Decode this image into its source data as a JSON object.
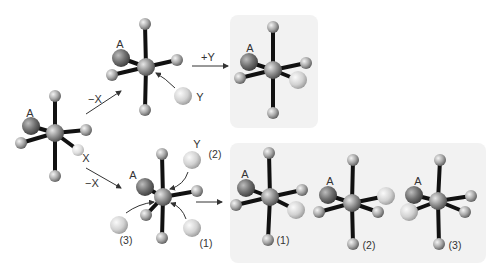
{
  "figure": {
    "colors": {
      "background": "#ffffff",
      "panel": "#f2f2f2",
      "bond": "#111111",
      "ligand": "#a9a9a9",
      "center": "#8f8f8f",
      "ligand_A": "#707070",
      "incoming_Y": "#d2d2d2",
      "leaving_X": "#dedede",
      "arrow": "#333333"
    },
    "labels": {
      "A": "A",
      "X": "X",
      "Y": "Y",
      "minus_X": "−X",
      "plus_Y": "+Y",
      "path_1": "(1)",
      "path_2": "(2)",
      "path_3": "(3)"
    }
  },
  "panels": [
    {
      "name": "product-panel-top",
      "x": 230,
      "y": 15,
      "w": 88,
      "h": 113
    },
    {
      "name": "product-panel-bottom",
      "x": 230,
      "y": 143,
      "w": 256,
      "h": 120
    }
  ],
  "molecules": [
    {
      "name": "reactant-octahedral-complex",
      "center": [
        55,
        133
      ],
      "balls": [
        {
          "role": "ligand",
          "pos": [
            55,
            96
          ],
          "r": 6
        },
        {
          "role": "ligand",
          "pos": [
            55,
            176
          ],
          "r": 6
        },
        {
          "role": "ligand_A",
          "pos": [
            31,
            126
          ],
          "r": 9
        },
        {
          "role": "ligand",
          "pos": [
            21,
            143
          ],
          "r": 6
        },
        {
          "role": "ligand",
          "pos": [
            86,
            130
          ],
          "r": 6
        },
        {
          "role": "leaving_X",
          "pos": [
            78,
            150
          ],
          "r": 6
        }
      ]
    },
    {
      "name": "intermediate-top-five-coordinate",
      "center": [
        146,
        67
      ],
      "balls": [
        {
          "role": "ligand",
          "pos": [
            145,
            24
          ],
          "r": 6
        },
        {
          "role": "ligand",
          "pos": [
            145,
            110
          ],
          "r": 6
        },
        {
          "role": "ligand_A",
          "pos": [
            121,
            58
          ],
          "r": 9
        },
        {
          "role": "ligand",
          "pos": [
            112,
            75
          ],
          "r": 6
        },
        {
          "role": "ligand",
          "pos": [
            177,
            60
          ],
          "r": 6
        }
      ]
    },
    {
      "name": "product-top",
      "center": [
        273,
        70
      ],
      "balls": [
        {
          "role": "ligand",
          "pos": [
            273,
            27
          ],
          "r": 6
        },
        {
          "role": "ligand",
          "pos": [
            273,
            113
          ],
          "r": 6
        },
        {
          "role": "ligand_A",
          "pos": [
            249,
            62
          ],
          "r": 9
        },
        {
          "role": "ligand",
          "pos": [
            240,
            78
          ],
          "r": 6
        },
        {
          "role": "ligand",
          "pos": [
            306,
            63
          ],
          "r": 6
        },
        {
          "role": "incoming_Y",
          "pos": [
            298,
            80
          ],
          "r": 9
        }
      ]
    },
    {
      "name": "intermediate-bottom-five-coordinate",
      "center": [
        163,
        197
      ],
      "balls": [
        {
          "role": "ligand",
          "pos": [
            162,
            154
          ],
          "r": 6
        },
        {
          "role": "ligand",
          "pos": [
            162,
            238
          ],
          "r": 6
        },
        {
          "role": "ligand_A",
          "pos": [
            145,
            187
          ],
          "r": 9
        },
        {
          "role": "ligand",
          "pos": [
            197,
            191
          ],
          "r": 6
        },
        {
          "role": "ligand",
          "pos": [
            146,
            215
          ],
          "r": 6
        }
      ]
    },
    {
      "name": "product-1",
      "center": [
        270,
        197
      ],
      "balls": [
        {
          "role": "ligand",
          "pos": [
            269,
            153
          ],
          "r": 6
        },
        {
          "role": "ligand",
          "pos": [
            268,
            240
          ],
          "r": 6
        },
        {
          "role": "ligand_A",
          "pos": [
            246,
            188
          ],
          "r": 9
        },
        {
          "role": "ligand",
          "pos": [
            236,
            205
          ],
          "r": 6
        },
        {
          "role": "ligand",
          "pos": [
            302,
            190
          ],
          "r": 6
        },
        {
          "role": "incoming_Y",
          "pos": [
            296,
            210
          ],
          "r": 9
        }
      ]
    },
    {
      "name": "product-2",
      "center": [
        352,
        203
      ],
      "balls": [
        {
          "role": "ligand",
          "pos": [
            353,
            160
          ],
          "r": 6
        },
        {
          "role": "ligand",
          "pos": [
            353,
            244
          ],
          "r": 6
        },
        {
          "role": "ligand_A",
          "pos": [
            328,
            195
          ],
          "r": 9
        },
        {
          "role": "ligand",
          "pos": [
            319,
            212
          ],
          "r": 6
        },
        {
          "role": "incoming_Y",
          "pos": [
            386,
            196
          ],
          "r": 9
        },
        {
          "role": "ligand",
          "pos": [
            378,
            212
          ],
          "r": 6
        }
      ]
    },
    {
      "name": "product-3",
      "center": [
        438,
        201
      ],
      "balls": [
        {
          "role": "ligand",
          "pos": [
            440,
            160
          ],
          "r": 6
        },
        {
          "role": "ligand",
          "pos": [
            439,
            244
          ],
          "r": 6
        },
        {
          "role": "ligand_A",
          "pos": [
            414,
            195
          ],
          "r": 9
        },
        {
          "role": "incoming_Y",
          "pos": [
            409,
            212
          ],
          "r": 9
        },
        {
          "role": "ligand",
          "pos": [
            471,
            196
          ],
          "r": 6
        },
        {
          "role": "ligand",
          "pos": [
            465,
            212
          ],
          "r": 6
        }
      ]
    }
  ],
  "free_ligands": [
    {
      "name": "incoming-Y-top",
      "pos": [
        183,
        96
      ],
      "r": 9
    },
    {
      "name": "incoming-Y-path-2",
      "pos": [
        192,
        160
      ],
      "r": 9
    },
    {
      "name": "incoming-Y-path-1",
      "pos": [
        192,
        228
      ],
      "r": 9
    },
    {
      "name": "incoming-Y-path-3",
      "pos": [
        119,
        225
      ],
      "r": 9
    }
  ],
  "arrows": [
    {
      "name": "arrow-loss-X-top",
      "from": [
        86,
        114
      ],
      "to": [
        121,
        91
      ],
      "straight": true
    },
    {
      "name": "arrow-loss-X-bottom",
      "from": [
        86,
        168
      ],
      "to": [
        121,
        188
      ],
      "straight": true
    },
    {
      "name": "arrow-add-Y-top",
      "from": [
        192,
        66
      ],
      "to": [
        228,
        66
      ],
      "straight": true
    },
    {
      "name": "arrow-to-products-bottom",
      "from": [
        196,
        202
      ],
      "to": [
        222,
        202
      ],
      "straight": true
    },
    {
      "name": "attack-arrow-top",
      "from": [
        175,
        88
      ],
      "ctrl": [
        165,
        78
      ],
      "to": [
        156,
        73
      ],
      "straight": false
    },
    {
      "name": "attack-arrow-path-2",
      "from": [
        188,
        172
      ],
      "ctrl": [
        184,
        185
      ],
      "to": [
        170,
        189
      ],
      "straight": false
    },
    {
      "name": "attack-arrow-path-1",
      "from": [
        186,
        219
      ],
      "ctrl": [
        182,
        207
      ],
      "to": [
        171,
        203
      ],
      "straight": false
    },
    {
      "name": "attack-arrow-path-3",
      "from": [
        126,
        213
      ],
      "ctrl": [
        138,
        204
      ],
      "to": [
        154,
        202
      ],
      "straight": false
    }
  ],
  "text_labels": [
    {
      "name": "label-A-reactant",
      "key": "A",
      "pos": [
        30,
        113
      ]
    },
    {
      "name": "label-X-reactant",
      "key": "X",
      "pos": [
        86,
        158
      ]
    },
    {
      "name": "label-minus-X-top",
      "key": "minus_X",
      "pos": [
        95,
        99
      ]
    },
    {
      "name": "label-minus-X-bottom",
      "key": "minus_X",
      "pos": [
        92,
        183
      ]
    },
    {
      "name": "label-A-intermediate-top",
      "key": "A",
      "pos": [
        120,
        44
      ]
    },
    {
      "name": "label-Y-top",
      "key": "Y",
      "pos": [
        200,
        97
      ]
    },
    {
      "name": "label-plus-Y",
      "key": "plus_Y",
      "pos": [
        208,
        57
      ]
    },
    {
      "name": "label-A-product-top",
      "key": "A",
      "pos": [
        250,
        48
      ]
    },
    {
      "name": "label-A-intermediate-bottom",
      "key": "A",
      "pos": [
        133,
        175
      ]
    },
    {
      "name": "label-Y-path-2",
      "key": "Y",
      "pos": [
        197,
        144
      ]
    },
    {
      "name": "label-path-2",
      "key": "path_2",
      "pos": [
        215,
        154
      ]
    },
    {
      "name": "label-path-3",
      "key": "path_3",
      "pos": [
        126,
        240
      ]
    },
    {
      "name": "label-path-1",
      "key": "path_1",
      "pos": [
        206,
        243
      ]
    },
    {
      "name": "label-A-product-1",
      "key": "A",
      "pos": [
        245,
        174
      ]
    },
    {
      "name": "label-path-1-product",
      "key": "path_1",
      "pos": [
        283,
        240
      ]
    },
    {
      "name": "label-A-product-2",
      "key": "A",
      "pos": [
        330,
        181
      ]
    },
    {
      "name": "label-path-2-product",
      "key": "path_2",
      "pos": [
        369,
        245
      ]
    },
    {
      "name": "label-A-product-3",
      "key": "A",
      "pos": [
        418,
        181
      ]
    },
    {
      "name": "label-path-3-product",
      "key": "path_3",
      "pos": [
        455,
        245
      ]
    }
  ]
}
